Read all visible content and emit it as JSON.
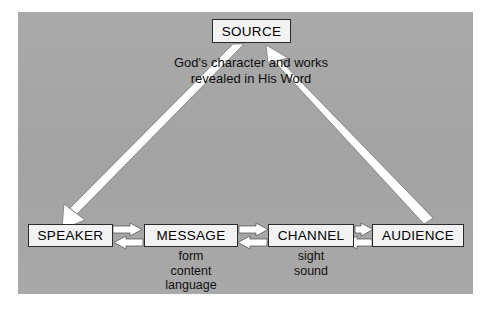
{
  "diagram": {
    "background_color": "#a6a6a6",
    "node_fill_color": "#f2f2f2",
    "arrow_fill_color": "#ffffff",
    "text_color": "#000000",
    "caption": "God's character and works\nrevealed in His Word",
    "nodes": {
      "source": "SOURCE",
      "speaker": "SPEAKER",
      "message": "MESSAGE",
      "channel": "CHANNEL",
      "audience": "AUDIENCE"
    },
    "sublabels": {
      "message": "form\ncontent\nlanguage",
      "channel": "sight\nsound"
    },
    "connectors": [
      {
        "name": "source-to-speaker",
        "from": "SOURCE",
        "to": "SPEAKER",
        "style": "tapered-line",
        "arrowhead_at": "SPEAKER"
      },
      {
        "name": "audience-to-source",
        "from": "AUDIENCE",
        "to": "SOURCE",
        "style": "tapered-line",
        "arrowhead_at": "SOURCE"
      },
      {
        "name": "speaker-message",
        "from": "SPEAKER",
        "to": "MESSAGE",
        "style": "double-block-arrow",
        "directions": "both"
      },
      {
        "name": "message-channel",
        "from": "MESSAGE",
        "to": "CHANNEL",
        "style": "double-block-arrow",
        "directions": "both"
      },
      {
        "name": "channel-audience",
        "from": "CHANNEL",
        "to": "AUDIENCE",
        "style": "double-block-arrow",
        "directions": "both"
      }
    ]
  }
}
